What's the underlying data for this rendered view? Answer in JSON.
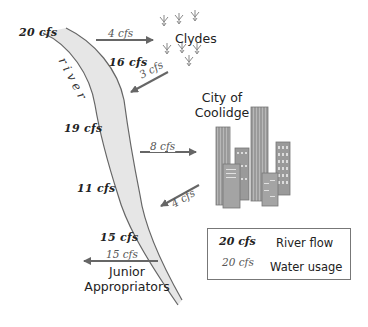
{
  "diagram": {
    "river_label": "river",
    "river_flows": [
      {
        "id": "flow-start",
        "label": "20 cfs"
      },
      {
        "id": "flow-after-clydes",
        "label": "16 cfs"
      },
      {
        "id": "flow-after-clydes-return",
        "label": "19 cfs"
      },
      {
        "id": "flow-after-city",
        "label": "11 cfs"
      },
      {
        "id": "flow-after-city-return",
        "label": "15 cfs"
      }
    ],
    "water_usage": [
      {
        "id": "clydes-diversion",
        "label": "4 cfs",
        "direction": "out",
        "to": "Clydes"
      },
      {
        "id": "clydes-return",
        "label": "3 cfs",
        "direction": "in",
        "from": "Clydes"
      },
      {
        "id": "city-diversion",
        "label": "8 cfs",
        "direction": "out",
        "to": "City of Coolidge"
      },
      {
        "id": "city-return",
        "label": "4 cfs",
        "direction": "in",
        "from": "City of Coolidge"
      },
      {
        "id": "junior-diversion",
        "label": "15 cfs",
        "direction": "out",
        "to": "Junior Appropriators"
      }
    ],
    "users": {
      "clydes": "Clydes",
      "city_line1": "City of",
      "city_line2": "Coolidge",
      "junior_line1": "Junior",
      "junior_line2": "Appropriators"
    },
    "colors": {
      "river_fill": "#e6e6e6",
      "river_edge": "#666666",
      "arrow": "#666666",
      "building": "#9a9a9a",
      "plant": "#888888"
    }
  },
  "legend": {
    "flow_sample": "20 cfs",
    "flow_label": "River flow",
    "usage_sample": "20 cfs",
    "usage_label": "Water usage"
  }
}
